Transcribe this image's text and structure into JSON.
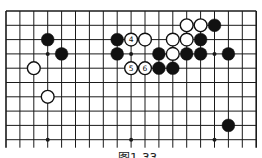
{
  "diagram": {
    "type": "go-board-fragment",
    "grid": {
      "columns": 19,
      "visible_rows": 10,
      "x0": 6,
      "dx": 13.9,
      "y0": 11,
      "dy": 14.3,
      "line_extend_below": 8,
      "line_color": "#1a1a1a"
    },
    "star_points": [
      {
        "col": 3,
        "row": 3
      },
      {
        "col": 9,
        "row": 3
      },
      {
        "col": 15,
        "row": 3
      },
      {
        "col": 3,
        "row": 9
      },
      {
        "col": 9,
        "row": 9
      },
      {
        "col": 15,
        "row": 9
      }
    ],
    "stones": [
      {
        "color": "black",
        "col": 3,
        "row": 2,
        "label": ""
      },
      {
        "color": "black",
        "col": 4,
        "row": 3,
        "label": ""
      },
      {
        "color": "white",
        "col": 2,
        "row": 4,
        "label": ""
      },
      {
        "color": "white",
        "col": 3,
        "row": 6,
        "label": ""
      },
      {
        "color": "black",
        "col": 8,
        "row": 2,
        "label": ""
      },
      {
        "color": "white",
        "col": 9,
        "row": 2,
        "label": "4"
      },
      {
        "color": "white",
        "col": 10,
        "row": 2,
        "label": ""
      },
      {
        "color": "black",
        "col": 8,
        "row": 3,
        "label": ""
      },
      {
        "color": "white",
        "col": 9,
        "row": 4,
        "label": "5"
      },
      {
        "color": "white",
        "col": 10,
        "row": 4,
        "label": "6"
      },
      {
        "color": "black",
        "col": 11,
        "row": 4,
        "label": ""
      },
      {
        "color": "black",
        "col": 12,
        "row": 4,
        "label": ""
      },
      {
        "color": "black",
        "col": 11,
        "row": 3,
        "label": ""
      },
      {
        "color": "white",
        "col": 12,
        "row": 3,
        "label": ""
      },
      {
        "color": "black",
        "col": 13,
        "row": 3,
        "label": ""
      },
      {
        "color": "black",
        "col": 14,
        "row": 3,
        "label": ""
      },
      {
        "color": "black",
        "col": 16,
        "row": 3,
        "label": ""
      },
      {
        "color": "white",
        "col": 12,
        "row": 2,
        "label": ""
      },
      {
        "color": "white",
        "col": 13,
        "row": 2,
        "label": ""
      },
      {
        "color": "black",
        "col": 14,
        "row": 2,
        "label": ""
      },
      {
        "color": "white",
        "col": 13,
        "row": 1,
        "label": ""
      },
      {
        "color": "white",
        "col": 14,
        "row": 1,
        "label": ""
      },
      {
        "color": "black",
        "col": 15,
        "row": 1,
        "label": ""
      },
      {
        "color": "black",
        "col": 16,
        "row": 8,
        "label": ""
      }
    ],
    "stone_radius": 6.4,
    "colors": {
      "black": "#111111",
      "white_fill": "#ffffff",
      "white_stroke": "#111111"
    }
  },
  "caption": "图1-33"
}
